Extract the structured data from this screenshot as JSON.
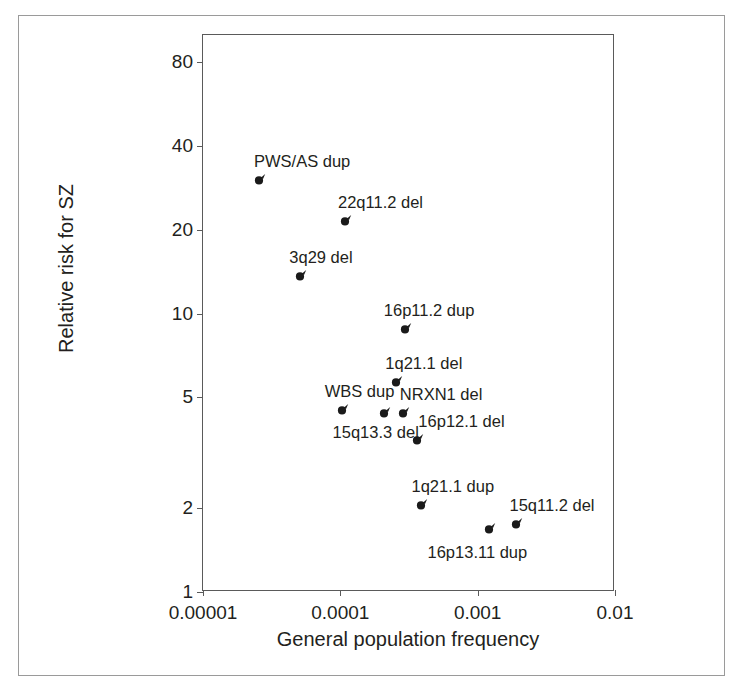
{
  "chart_data": {
    "type": "scatter",
    "title": "",
    "xlabel": "General population frequency",
    "ylabel": "Relative risk for SZ",
    "xscale": "log",
    "yscale": "log",
    "xlim": [
      1e-05,
      0.01
    ],
    "ylim": [
      1,
      100
    ],
    "grid": false,
    "legend": "none",
    "xticks": [
      {
        "value": 1e-05,
        "label": "0.00001"
      },
      {
        "value": 0.0001,
        "label": "0.0001"
      },
      {
        "value": 0.001,
        "label": "0.001"
      },
      {
        "value": 0.01,
        "label": "0.01"
      }
    ],
    "yticks": [
      {
        "value": 1,
        "label": "1"
      },
      {
        "value": 2,
        "label": "2"
      },
      {
        "value": 5,
        "label": "5"
      },
      {
        "value": 10,
        "label": "10"
      },
      {
        "value": 20,
        "label": "20"
      },
      {
        "value": 40,
        "label": "40"
      },
      {
        "value": 80,
        "label": "80"
      }
    ],
    "marker_color": "#1a1a1a",
    "points": [
      {
        "label": "PWS/AS dup",
        "x": 2.6e-05,
        "y": 31.0,
        "label_dx": -6,
        "label_dy": -24
      },
      {
        "label": "22q11.2 del",
        "x": 0.00011,
        "y": 22.0,
        "label_dx": -8,
        "label_dy": -24
      },
      {
        "label": "3q29 del",
        "x": 5.2e-05,
        "y": 14.0,
        "label_dx": -12,
        "label_dy": -24
      },
      {
        "label": "16p11.2 dup",
        "x": 0.0003,
        "y": 9.0,
        "label_dx": -22,
        "label_dy": -24
      },
      {
        "label": "1q21.1 del",
        "x": 0.00026,
        "y": 5.8,
        "label_dx": -12,
        "label_dy": -24
      },
      {
        "label": "WBS dup",
        "x": 0.000104,
        "y": 4.6,
        "label_dx": -18,
        "label_dy": -24
      },
      {
        "label": "15q13.3 del",
        "x": 0.00021,
        "y": 4.5,
        "label_dx": -52,
        "label_dy": 14
      },
      {
        "label": "NRXN1 del",
        "x": 0.00029,
        "y": 4.5,
        "label_dx": -4,
        "label_dy": -24
      },
      {
        "label": "16p12.1 del",
        "x": 0.00037,
        "y": 3.6,
        "label_dx": 0,
        "label_dy": -24
      },
      {
        "label": "1q21.1 dup",
        "x": 0.00039,
        "y": 2.1,
        "label_dx": -10,
        "label_dy": -24
      },
      {
        "label": "16p13.11 dup",
        "x": 0.00122,
        "y": 1.72,
        "label_dx": -62,
        "label_dy": 18
      },
      {
        "label": "15q11.2 del",
        "x": 0.00195,
        "y": 1.8,
        "label_dx": -8,
        "label_dy": -24
      }
    ]
  }
}
